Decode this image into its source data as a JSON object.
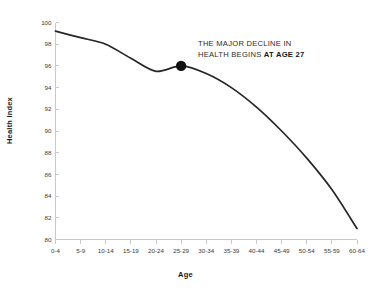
{
  "chart_data": {
    "type": "line",
    "title": "",
    "xlabel": "Age",
    "ylabel": "Health Index",
    "categories": [
      "0-4",
      "5-9",
      "10-14",
      "15-19",
      "20-24",
      "25-29",
      "30-34",
      "35-39",
      "40-44",
      "45-49",
      "50-54",
      "55-59",
      "60-64"
    ],
    "values": [
      99.2,
      98.6,
      98.0,
      96.7,
      95.5,
      96.0,
      95.3,
      94.0,
      92.2,
      90.0,
      87.5,
      84.6,
      81.0
    ],
    "series": [
      {
        "name": "Health Index",
        "values": [
          99.2,
          98.6,
          98.0,
          96.7,
          95.5,
          96.0,
          95.3,
          94.0,
          92.2,
          90.0,
          87.5,
          84.6,
          81.0
        ]
      }
    ],
    "ylim": [
      80,
      100
    ],
    "yticks": [
      80,
      82,
      84,
      86,
      88,
      90,
      92,
      94,
      96,
      98,
      100
    ],
    "ytick_labels": [
      "80",
      "82",
      "84",
      "86",
      "88",
      "90",
      "92",
      "94",
      "96",
      "98",
      "100"
    ],
    "grid": false,
    "legend": false,
    "legend_position": "none",
    "line_color": "#262626",
    "axis_color": "#c9c9c9",
    "marker": {
      "category": "25-29",
      "value": 96.0,
      "color": "#111111",
      "label": "AT AGE 27"
    },
    "annotations": [
      {
        "text_line1": "THE MAJOR DECLINE IN",
        "text_line2_regular": "HEALTH BEGINS ",
        "text_line2_bold": "AT AGE 27"
      }
    ]
  }
}
